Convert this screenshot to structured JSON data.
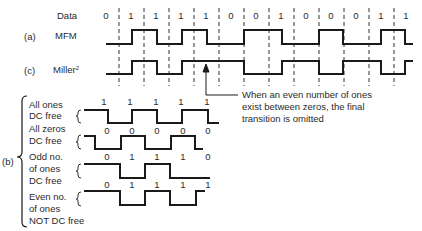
{
  "header": {
    "data_label": "Data",
    "data_bits": [
      "0",
      "1",
      "1",
      "1",
      "1",
      "0",
      "0",
      "1",
      "0",
      "0",
      "0",
      "1",
      "1"
    ]
  },
  "rows": {
    "mfm": {
      "tag": "(a)",
      "label": "MFM"
    },
    "miller": {
      "tag": "(c)",
      "label": "Miller",
      "superscript": "2"
    }
  },
  "annotation": {
    "lines": [
      "When an even number of ones",
      "exist between zeros, the final",
      "transition is omitted"
    ]
  },
  "section_b": {
    "tag": "(b)",
    "groups": [
      {
        "label_lines": [
          "All ones",
          "DC free"
        ],
        "bits_top": [
          "1",
          "1",
          "1",
          "1",
          "1"
        ],
        "bits_bottom": [
          "0",
          "0",
          "0",
          "0",
          "0"
        ]
      },
      {
        "label_lines": [
          "All zeros",
          "DC free"
        ],
        "bits_top": [],
        "bits_bottom": []
      },
      {
        "label_lines": [
          "Odd no.",
          "of ones",
          "DC free"
        ],
        "bits_top": [
          "0",
          "1",
          "1",
          "1",
          "0"
        ]
      },
      {
        "label_lines": [
          "Even no.",
          "of ones",
          "NOT DC free"
        ],
        "bits_top": [
          "0",
          "1",
          "1",
          "1",
          "1"
        ]
      }
    ]
  },
  "colors": {
    "line": "#1a1a1a",
    "text": "#2a2a2a",
    "background": "#ffffff"
  }
}
